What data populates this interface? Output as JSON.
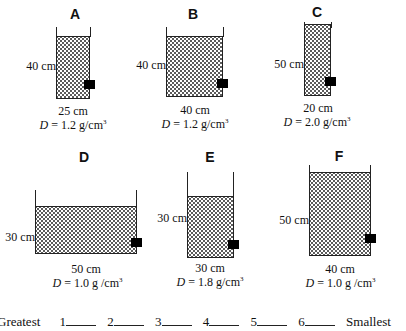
{
  "containers": [
    {
      "letter": "A",
      "height": "40 cm",
      "width": "25 cm",
      "density_prefix": "D",
      "density_value": " = 1.2 g/cm",
      "density_unit_exp": "3"
    },
    {
      "letter": "B",
      "height": "40 cm",
      "width": "40 cm",
      "density_prefix": "D",
      "density_value": " = 1.2 g/cm",
      "density_unit_exp": "3"
    },
    {
      "letter": "C",
      "height": "50 cm",
      "width": "20 cm",
      "density_prefix": "D",
      "density_value": " = 2.0 g/cm",
      "density_unit_exp": "3"
    },
    {
      "letter": "D",
      "height": "30 cm",
      "width": "50 cm",
      "density_prefix": "D",
      "density_value": " = 1.0 g /cm",
      "density_unit_exp": "3"
    },
    {
      "letter": "E",
      "height": "30 cm",
      "width": "30 cm",
      "density_prefix": "D",
      "density_value": " = 1.8 g/cm",
      "density_unit_exp": "3"
    },
    {
      "letter": "F",
      "height": "50 cm",
      "width": "40 cm",
      "density_prefix": "D",
      "density_value": " = 1.0 g /cm",
      "density_unit_exp": "3"
    }
  ],
  "ranking": {
    "start_label": "Greatest",
    "slots": [
      "1",
      "2",
      "3",
      "4",
      "5",
      "6"
    ],
    "end_label": "Smallest"
  }
}
